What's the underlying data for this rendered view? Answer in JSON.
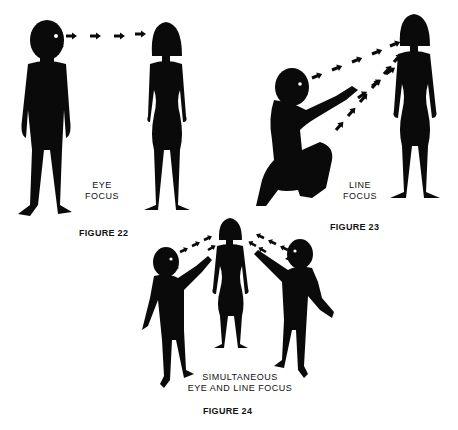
{
  "figures": [
    {
      "id": "figure-22",
      "label": "FIGURE 22",
      "caption_line1": "EYE",
      "caption_line2": "FOCUS"
    },
    {
      "id": "figure-23",
      "label": "FIGURE 23",
      "caption_line1": "LINE",
      "caption_line2": "FOCUS"
    },
    {
      "id": "figure-24",
      "label": "FIGURE 24",
      "caption_line1": "SIMULTANEOUS",
      "caption_line2": "EYE AND LINE FOCUS"
    }
  ],
  "colors": {
    "silhouette": "#0a0a0a",
    "background": "#ffffff"
  }
}
